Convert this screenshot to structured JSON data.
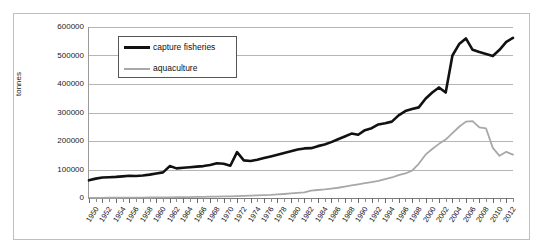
{
  "chart_data": {
    "type": "line",
    "title": "",
    "xlabel": "",
    "ylabel": "tonnes",
    "ylim": [
      0,
      600000
    ],
    "ytick_values": [
      0,
      100000,
      200000,
      300000,
      400000,
      500000,
      600000
    ],
    "ytick_labels": [
      "0",
      "100000",
      "200000",
      "300000",
      "400000",
      "500000",
      "600000"
    ],
    "grid": true,
    "legend_position": "top-left-inside",
    "x": [
      1950,
      1951,
      1952,
      1953,
      1954,
      1955,
      1956,
      1957,
      1958,
      1959,
      1960,
      1961,
      1962,
      1963,
      1964,
      1965,
      1966,
      1967,
      1968,
      1969,
      1970,
      1971,
      1972,
      1973,
      1974,
      1975,
      1976,
      1977,
      1978,
      1979,
      1980,
      1981,
      1982,
      1983,
      1984,
      1985,
      1986,
      1987,
      1988,
      1989,
      1990,
      1991,
      1992,
      1993,
      1994,
      1995,
      1996,
      1997,
      1998,
      1999,
      2000,
      2001,
      2002,
      2003,
      2004,
      2005,
      2006,
      2007,
      2008,
      2009,
      2010,
      2011,
      2012,
      2013
    ],
    "xtick_labels": [
      "1950",
      "1952",
      "1954",
      "1956",
      "1958",
      "1960",
      "1962",
      "1964",
      "1966",
      "1968",
      "1970",
      "1972",
      "1974",
      "1976",
      "1978",
      "1980",
      "1982",
      "1984",
      "1986",
      "1988",
      "1990",
      "1992",
      "1994",
      "1996",
      "1998",
      "2000",
      "2002",
      "2004",
      "2006",
      "2008",
      "2010",
      "2012"
    ],
    "series": [
      {
        "name": "capture fisheries",
        "color": "#111111",
        "width": 2.6,
        "values": [
          62000,
          68000,
          72000,
          73000,
          74000,
          76000,
          78000,
          77000,
          79000,
          82000,
          86000,
          90000,
          112000,
          104000,
          106000,
          108000,
          110000,
          112000,
          116000,
          122000,
          120000,
          113000,
          161000,
          132000,
          130000,
          134000,
          140000,
          146000,
          152000,
          158000,
          164000,
          170000,
          174000,
          175000,
          182000,
          188000,
          196000,
          206000,
          216000,
          226000,
          222000,
          238000,
          245000,
          258000,
          262000,
          268000,
          290000,
          305000,
          312000,
          318000,
          348000,
          370000,
          388000,
          370000,
          500000,
          540000,
          560000,
          520000,
          512000,
          505000,
          498000,
          520000,
          548000,
          562000
        ]
      },
      {
        "name": "aquaculture",
        "color": "#a8a8a8",
        "width": 1.8,
        "values": [
          500,
          600,
          700,
          800,
          900,
          1000,
          1200,
          1400,
          1600,
          1800,
          2000,
          2200,
          2500,
          2800,
          3100,
          3400,
          3800,
          4200,
          4600,
          5000,
          5500,
          6000,
          6500,
          7200,
          8000,
          9000,
          10000,
          11000,
          12500,
          14000,
          16000,
          18000,
          20000,
          26000,
          28000,
          30000,
          33000,
          36000,
          40000,
          44000,
          48000,
          52000,
          56000,
          60000,
          66000,
          72000,
          80000,
          86000,
          96000,
          120000,
          152000,
          172000,
          190000,
          205000,
          228000,
          250000,
          268000,
          270000,
          248000,
          244000,
          176000,
          148000,
          162000,
          152000
        ]
      }
    ]
  },
  "legend": {
    "items": [
      {
        "label": "capture fisheries",
        "style": "thick-black"
      },
      {
        "label": "aquaculture",
        "style": "thin-gray"
      }
    ]
  },
  "axis": {
    "y_title": "tonnes"
  }
}
